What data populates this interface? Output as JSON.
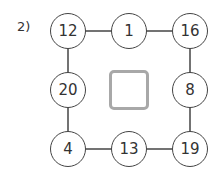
{
  "problem": {
    "label": "2)",
    "nodes": {
      "top_left": "12",
      "top_middle": "1",
      "top_right": "16",
      "middle_left": "20",
      "middle_right": "8",
      "bottom_left": "4",
      "bottom_middle": "13",
      "bottom_right": "19"
    },
    "center_box": ""
  },
  "colors": {
    "line": "#444444",
    "box_border": "#a8a8a8"
  }
}
